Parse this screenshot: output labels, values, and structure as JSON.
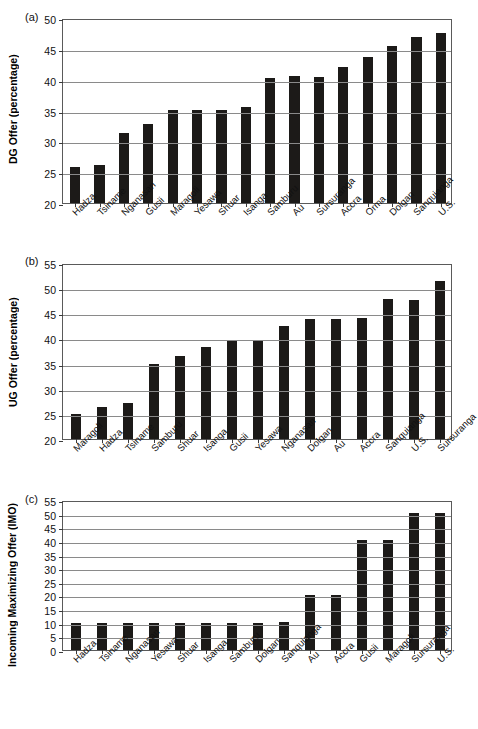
{
  "figure": {
    "background": "#ffffff",
    "bar_color": "#1c1a18",
    "grid_color": "#8a8a8a",
    "axis_color": "#5a5a5a"
  },
  "panels": {
    "a": {
      "tag": "(a)"
    },
    "b": {
      "tag": "(b)"
    },
    "c": {
      "tag": "(c)"
    }
  },
  "chart_data": [
    {
      "type": "bar",
      "panel": "(a)",
      "title": "",
      "xlabel": "",
      "ylabel": "DG Offer (percentage)",
      "ylim": [
        20,
        50
      ],
      "ytick_step": 5,
      "yticks": [
        "50",
        "45",
        "40",
        "35",
        "30",
        "25",
        "20"
      ],
      "grid": true,
      "legend": "none",
      "categories": [
        "Hadza",
        "Tsiname",
        "Nganasan",
        "Gusii",
        "Maragoli",
        "Yesawa",
        "Shuar",
        "Isanga",
        "Samburu",
        "Au",
        "Sursuranga",
        "Accra",
        "Orma",
        "Dolgan",
        "Sanquianga",
        "U.S."
      ],
      "values": [
        25.9,
        26.1,
        31.3,
        32.8,
        35.1,
        35.1,
        35.1,
        35.6,
        40.2,
        40.6,
        40.5,
        42.0,
        43.7,
        45.4,
        47.0,
        47.5
      ]
    },
    {
      "type": "bar",
      "panel": "(b)",
      "title": "",
      "xlabel": "",
      "ylabel": "UG Offer (percentage)",
      "ylim": [
        20,
        55
      ],
      "ytick_step": 5,
      "yticks": [
        "55",
        "50",
        "45",
        "40",
        "35",
        "30",
        "25",
        "20"
      ],
      "grid": true,
      "legend": "none",
      "categories": [
        "Maragoli",
        "Hadza",
        "Tsiname",
        "Samburu",
        "Shuar",
        "Isanga",
        "Gusii",
        "Yesawa",
        "Nganasan",
        "Dolgan",
        "Au",
        "Accra",
        "Sanquianga",
        "U.S.",
        "Sursuranga"
      ],
      "values": [
        25.0,
        26.3,
        27.1,
        35.0,
        36.6,
        38.2,
        39.4,
        39.5,
        42.4,
        43.8,
        43.9,
        44.0,
        47.9,
        47.7,
        51.4
      ]
    },
    {
      "type": "bar",
      "panel": "(c)",
      "title": "",
      "xlabel": "",
      "ylabel": "Incoming Maximizing Offer (IMO)",
      "ylim": [
        0,
        55
      ],
      "ytick_step": 5,
      "yticks": [
        "55",
        "50",
        "45",
        "40",
        "35",
        "30",
        "25",
        "20",
        "15",
        "10",
        "5",
        "0"
      ],
      "grid": true,
      "legend": "none",
      "categories": [
        "Hadza",
        "Tsiname",
        "Nganasan",
        "Yesawa",
        "Shuar",
        "Isanga",
        "Samburu",
        "Dolgan",
        "Sanquianga",
        "Au",
        "Accra",
        "Gusii",
        "Maragoli",
        "Sursuranga",
        "U.S."
      ],
      "values": [
        10,
        10,
        10,
        10,
        10,
        10,
        10,
        10,
        10.3,
        20.2,
        20.2,
        40.5,
        40.5,
        50.2,
        50.2
      ]
    }
  ]
}
